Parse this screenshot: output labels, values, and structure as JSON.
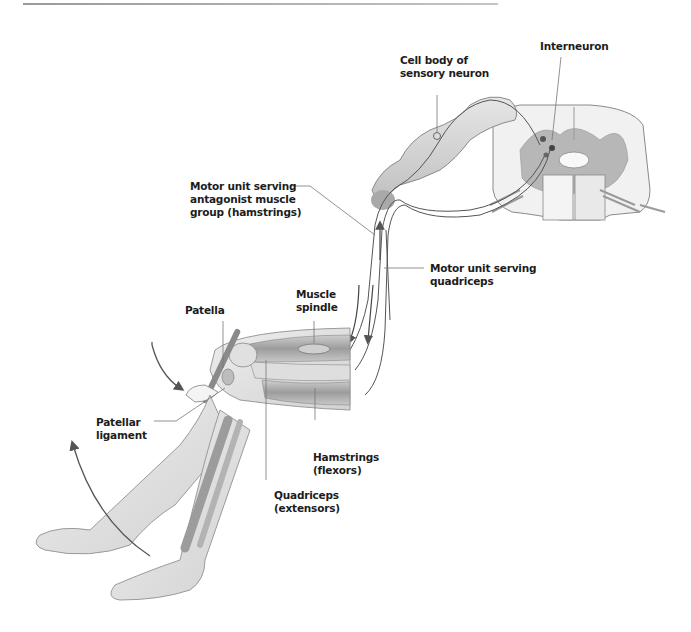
{
  "figure": {
    "colors": {
      "tissue": "#d9d9d9",
      "tissue_dark": "#a8a8a8",
      "outline": "#8a8a8a",
      "nerve": "#555555",
      "text": "#1c1c1c",
      "leader_line": "#777777"
    }
  },
  "labels": {
    "interneuron": "Interneuron",
    "cell_body": "Cell body of\nsensory neuron",
    "motor_antagonist": "Motor unit serving\nantagonist muscle\ngroup (hamstrings)",
    "motor_quadriceps": "Motor unit serving\nquadriceps",
    "muscle_spindle": "Muscle\nspindle",
    "patella": "Patella",
    "patellar_ligament": "Patellar\nligament",
    "hamstrings": "Hamstrings\n(flexors)",
    "quadriceps": "Quadriceps\n(extensors)"
  }
}
